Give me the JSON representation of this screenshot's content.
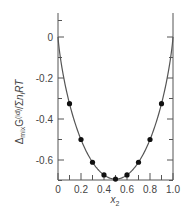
{
  "chart_data": {
    "type": "line",
    "title": "",
    "xlabel": "x2",
    "ylabel": "ΔmixG(id)/Σi ni RT",
    "xlim": [
      0,
      1.0
    ],
    "ylim": [
      -0.7,
      0.1
    ],
    "grid": false,
    "legend": null,
    "x_ticks": [
      "0",
      "0.2",
      "0.4",
      "0.6",
      "0.8",
      "1.0"
    ],
    "y_ticks": [
      "0",
      "-0.2",
      "-0.4",
      "-0.6"
    ],
    "series": [
      {
        "name": "curve",
        "style": "line",
        "x": [
          0,
          0.1,
          0.2,
          0.3,
          0.4,
          0.5,
          0.6,
          0.7,
          0.8,
          0.9,
          1.0
        ],
        "values": [
          0,
          -0.325,
          -0.5,
          -0.611,
          -0.673,
          -0.693,
          -0.673,
          -0.611,
          -0.5,
          -0.325,
          0
        ]
      },
      {
        "name": "points",
        "style": "markers",
        "x": [
          0.1,
          0.2,
          0.3,
          0.4,
          0.5,
          0.6,
          0.7,
          0.8,
          0.9
        ],
        "values": [
          -0.325,
          -0.5,
          -0.611,
          -0.673,
          -0.693,
          -0.673,
          -0.611,
          -0.5,
          -0.325
        ]
      }
    ]
  },
  "labels": {
    "x_axis": {
      "main": "x",
      "sub": "2"
    },
    "y_axis": {
      "delta": "Δ",
      "mix": "mix",
      "G": "G",
      "id": "(id)",
      "slash": "/",
      "sigma": "Σ",
      "i": "i",
      "n": "n",
      "ni": "i",
      "RT": "RT"
    }
  },
  "colors": {
    "axis": "#555555",
    "curve": "#555555",
    "points": "#111111",
    "text": "#444444"
  }
}
